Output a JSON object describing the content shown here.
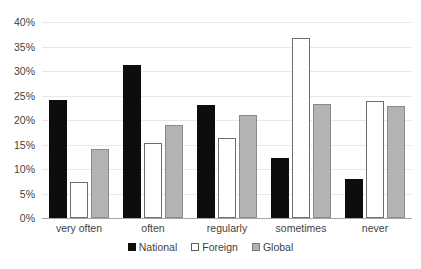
{
  "chart_data": {
    "type": "bar",
    "title": "",
    "subtitle": "",
    "xlabel": "",
    "ylabel": "",
    "categories": [
      "very often",
      "often",
      "regularly",
      "sometimes",
      "never"
    ],
    "series": [
      {
        "name": "National",
        "color": "#0d0d0d",
        "values": [
          24.0,
          31.2,
          23.0,
          12.2,
          8.0
        ]
      },
      {
        "name": "Foreign",
        "color": "#ffffff",
        "values": [
          7.3,
          15.3,
          16.3,
          36.8,
          23.8
        ]
      },
      {
        "name": "Global",
        "color": "#b3b3b3",
        "values": [
          14.0,
          19.0,
          21.0,
          23.2,
          22.8
        ]
      }
    ],
    "ylim": [
      0,
      40
    ],
    "ytick_step": 5,
    "ytick_labels": [
      "0%",
      "5%",
      "10%",
      "15%",
      "20%",
      "25%",
      "30%",
      "35%",
      "40%"
    ],
    "grid": true,
    "legend_position": "bottom",
    "value_unit": "percent"
  },
  "legend": {
    "items": [
      {
        "label": "National",
        "swatch": "filled-black-square-icon"
      },
      {
        "label": "Foreign",
        "swatch": "outline-white-square-icon"
      },
      {
        "label": "Global",
        "swatch": "filled-gray-square-icon"
      }
    ]
  }
}
